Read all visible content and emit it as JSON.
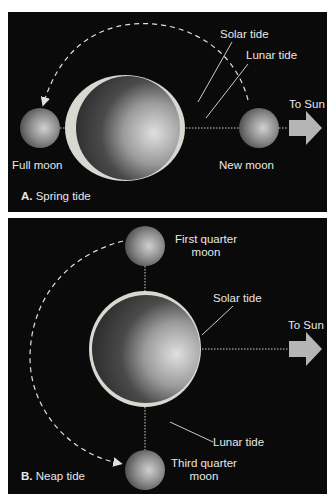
{
  "figure": {
    "panels": [
      {
        "id": "A",
        "caption_letter": "A.",
        "caption_text": "Spring tide",
        "labels": {
          "solar_tide": "Solar tide",
          "lunar_tide": "Lunar tide",
          "to_sun": "To Sun",
          "full_moon": "Full moon",
          "new_moon": "New moon"
        }
      },
      {
        "id": "B",
        "caption_letter": "B.",
        "caption_text": "Neap tide",
        "labels": {
          "first_quarter_line1": "First quarter",
          "first_quarter_line2": "moon",
          "solar_tide": "Solar tide",
          "to_sun": "To Sun",
          "lunar_tide": "Lunar tide",
          "third_quarter_line1": "Third quarter",
          "third_quarter_line2": "moon"
        }
      }
    ],
    "colors": {
      "background": "#0a0a0a",
      "label_text": "#e8e8e8",
      "arrow_fill": "#b5b5b5",
      "tide_bulge": "#d8d8d0"
    }
  }
}
